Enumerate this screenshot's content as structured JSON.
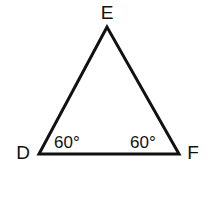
{
  "diagram": {
    "type": "triangle",
    "vertices": [
      {
        "name": "E",
        "label": "E"
      },
      {
        "name": "D",
        "label": "D"
      },
      {
        "name": "F",
        "label": "F"
      }
    ],
    "angles": [
      {
        "vertex": "D",
        "label": "60°"
      },
      {
        "vertex": "F",
        "label": "60°"
      }
    ],
    "stroke_color": "#111111"
  }
}
